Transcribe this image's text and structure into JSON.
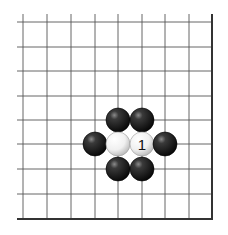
{
  "diagram": {
    "type": "go-board-fragment",
    "grid": {
      "x_lines": [
        23,
        47,
        71,
        95,
        118,
        142,
        165,
        189
      ],
      "y_lines": [
        22,
        47,
        71,
        96,
        120,
        144,
        169,
        194
      ],
      "left_extent": 17,
      "top_extent": 14,
      "right_edge": 212,
      "bottom_edge": 219,
      "line_color": "#555555",
      "edge_color": "#333333"
    },
    "stone_radius": 12,
    "stones": [
      {
        "color": "black",
        "x": 118,
        "y": 120,
        "label": ""
      },
      {
        "color": "black",
        "x": 142,
        "y": 120,
        "label": ""
      },
      {
        "color": "black",
        "x": 95,
        "y": 144,
        "label": ""
      },
      {
        "color": "white",
        "x": 118,
        "y": 144,
        "label": ""
      },
      {
        "color": "white",
        "x": 142,
        "y": 144,
        "label": "1"
      },
      {
        "color": "black",
        "x": 165,
        "y": 144,
        "label": ""
      },
      {
        "color": "black",
        "x": 118,
        "y": 169,
        "label": ""
      },
      {
        "color": "black",
        "x": 142,
        "y": 169,
        "label": ""
      }
    ]
  }
}
